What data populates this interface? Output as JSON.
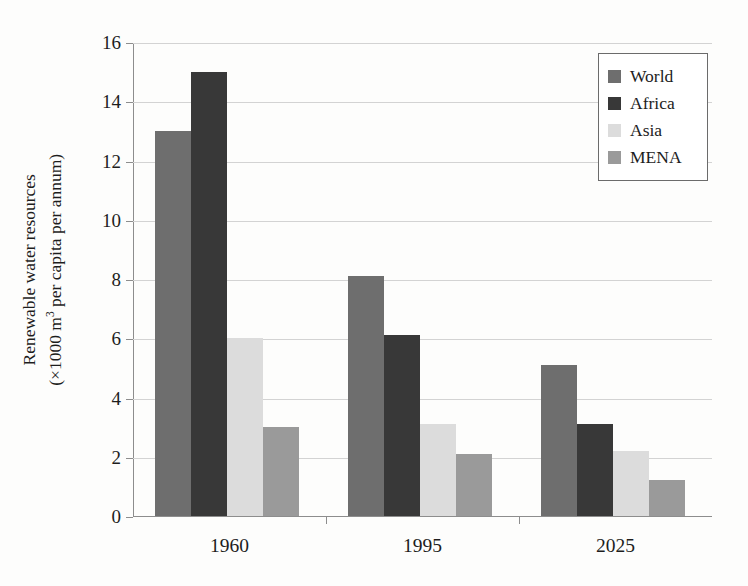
{
  "chart_data": {
    "type": "bar",
    "title": "",
    "subtitle": "",
    "xlabel": "",
    "ylabel": "Renewable water resources (×1000 m³ per capita per annum)",
    "ylabel_line1": "Renewable water resources",
    "ylabel_line2_prefix": "(×1000 m",
    "ylabel_line2_sup": "3",
    "ylabel_line2_suffix": " per capita per annum)",
    "categories": [
      "1960",
      "1995",
      "2025"
    ],
    "series": [
      {
        "name": "World",
        "color": "#6e6e6e",
        "values": [
          13,
          8.1,
          5.1
        ]
      },
      {
        "name": "Africa",
        "color": "#383838",
        "values": [
          15,
          6.1,
          3.1
        ]
      },
      {
        "name": "Asia",
        "color": "#dcdcdc",
        "values": [
          6,
          3.1,
          2.2
        ]
      },
      {
        "name": "MENA",
        "color": "#9a9a9a",
        "values": [
          3,
          2.1,
          1.2
        ]
      }
    ],
    "ylim": [
      0,
      16
    ],
    "ytick_step": 2,
    "yticks": [
      "0",
      "2",
      "4",
      "6",
      "8",
      "10",
      "12",
      "14",
      "16"
    ],
    "grid": "horizontal",
    "legend_position": "top-right",
    "legend_entries": [
      "World",
      "Africa",
      "Asia",
      "MENA"
    ],
    "background_color": "#fdfdfc",
    "axis_color": "#8d8d8d",
    "gridline_color": "#d3d3d3",
    "text_color": "#1d1d1d"
  }
}
